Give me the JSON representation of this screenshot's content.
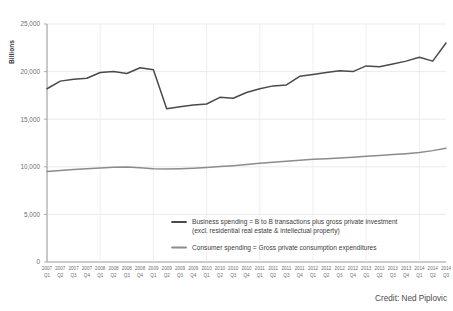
{
  "credit": "Credit: Ned Piplovic",
  "axis": {
    "y_label": "Billions",
    "y_ticks": [
      "0",
      "5,000",
      "10,000",
      "15,000",
      "20,000",
      "25,000"
    ]
  },
  "legend": {
    "items": [
      {
        "name": "business-spending",
        "line1": "Business spending = B to B transactions plus gross private investment",
        "line2": "(excl. residential real estate & intellectual property)",
        "color": "#4a4a4a"
      },
      {
        "name": "consumer-spending",
        "line1": "Consumer spending = Gross private consumption expenditures",
        "line2": "",
        "color": "#8c8c8c"
      }
    ]
  },
  "chart_data": {
    "type": "line",
    "title": "",
    "xlabel": "",
    "ylabel": "Billions",
    "ylim": [
      0,
      25000
    ],
    "yticks": [
      0,
      5000,
      10000,
      15000,
      20000,
      25000
    ],
    "grid": true,
    "legend_position": "inside-bottom-center",
    "categories": [
      "2007 Q1",
      "2007 Q2",
      "2007 Q3",
      "2007 Q4",
      "2008 Q1",
      "2008 Q2",
      "2008 Q3",
      "2008 Q4",
      "2009 Q1",
      "2009 Q2",
      "2009 Q3",
      "2009 Q4",
      "2010 Q1",
      "2010 Q2",
      "2010 Q3",
      "2010 Q4",
      "2011 Q1",
      "2011 Q2",
      "2011 Q3",
      "2011 Q4",
      "2012 Q1",
      "2012 Q2",
      "2012 Q3",
      "2012 Q4",
      "2013 Q1",
      "2013 Q2",
      "2013 Q3",
      "2013 Q4",
      "2014 Q1",
      "2014 Q2",
      "2014 Q3"
    ],
    "x_tick_years": [
      "2007",
      "2007",
      "2007",
      "2007",
      "2008",
      "2008",
      "2008",
      "2008",
      "2009",
      "2009",
      "2009",
      "2009",
      "2010",
      "2010",
      "2010",
      "2010",
      "2011",
      "2011",
      "2011",
      "2011",
      "2012",
      "2012",
      "2012",
      "2012",
      "2013",
      "2013",
      "2013",
      "2013",
      "2014",
      "2014",
      "2014"
    ],
    "x_tick_quarters": [
      "Q1",
      "Q2",
      "Q3",
      "Q4",
      "Q1",
      "Q2",
      "Q3",
      "Q4",
      "Q1",
      "Q2",
      "Q3",
      "Q4",
      "Q1",
      "Q2",
      "Q3",
      "Q4",
      "Q1",
      "Q2",
      "Q3",
      "Q4",
      "Q1",
      "Q2",
      "Q3",
      "Q4",
      "Q1",
      "Q2",
      "Q3",
      "Q4",
      "Q1",
      "Q2",
      "Q3"
    ],
    "series": [
      {
        "name": "Business spending = B to B transactions plus gross private investment (excl. residential real estate & intellectual property)",
        "short_name": "Business spending",
        "color": "#4a4a4a",
        "values": [
          18200,
          19000,
          19200,
          19300,
          19900,
          20000,
          19800,
          20400,
          20200,
          16100,
          16300,
          16500,
          16600,
          17300,
          17200,
          17800,
          18200,
          18500,
          18600,
          19500,
          19700,
          19900,
          20100,
          20000,
          20600,
          20500,
          20800,
          21100,
          21500,
          21100,
          23000
        ]
      },
      {
        "name": "Consumer spending = Gross private consumption expenditures",
        "short_name": "Consumer spending",
        "color": "#8c8c8c",
        "values": [
          9500,
          9620,
          9720,
          9800,
          9870,
          9950,
          9980,
          9900,
          9800,
          9780,
          9800,
          9850,
          9920,
          10020,
          10120,
          10250,
          10380,
          10480,
          10580,
          10680,
          10780,
          10850,
          10930,
          11010,
          11100,
          11180,
          11280,
          11380,
          11500,
          11700,
          11950
        ]
      }
    ]
  }
}
